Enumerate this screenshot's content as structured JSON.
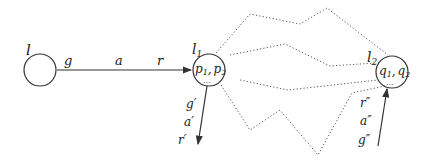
{
  "nodes": [
    {
      "id": "l",
      "label": "l",
      "contents": "",
      "extra": ""
    },
    {
      "id": "l1",
      "label": "l",
      "label_sub": "1",
      "contents": "p1, p2",
      "c1": "p",
      "c1_sub": "1",
      "c2": "p",
      "c2_sub": "2",
      "extra": "..."
    },
    {
      "id": "l2",
      "label": "l",
      "label_sub": "2",
      "contents": "q1, q2",
      "c1": "q",
      "c1_sub": "1",
      "c2": "q",
      "c2_sub": "2",
      "extra": "..."
    }
  ],
  "edges": [
    {
      "from": "l",
      "to": "l1",
      "labels": [
        "g",
        "a",
        "r"
      ]
    },
    {
      "from": "l1",
      "to": "out",
      "labels": [
        "g′",
        "a′",
        "r′"
      ]
    },
    {
      "from": "in",
      "to": "l2",
      "labels": [
        "r″",
        "a″",
        "g″"
      ]
    }
  ],
  "comma": ","
}
